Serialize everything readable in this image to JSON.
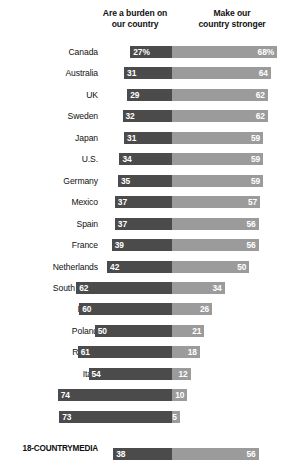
{
  "chart_data": {
    "type": "bar",
    "subtype": "diverging-stacked-bar",
    "title": "",
    "xlabel": "",
    "ylabel": "",
    "grid": false,
    "legend_position": "top",
    "axis_note": "Percent; left segment diverges leftward from a shared center line, right segment extends rightward",
    "series": [
      {
        "name": "Are a burden on our country",
        "color": "#4b4b4b",
        "direction": "left"
      },
      {
        "name": "Make our country stronger",
        "color": "#9b9b9b",
        "direction": "right"
      }
    ],
    "categories": [
      "Canada",
      "Australia",
      "UK",
      "Sweden",
      "Japan",
      "U.S.",
      "Germany",
      "Mexico",
      "Spain",
      "France",
      "Netherlands",
      "South Africa",
      "Israel",
      "Poland",
      "Russia",
      "Italy",
      "Greece",
      "Hungary",
      "18-COUNTRY MEDIA"
    ],
    "rows": [
      {
        "label": "Canada",
        "left": 27,
        "right": 68,
        "left_text": "27%",
        "right_text": "68%",
        "median": false
      },
      {
        "label": "Australia",
        "left": 31,
        "right": 64,
        "left_text": "31",
        "right_text": "64",
        "median": false
      },
      {
        "label": "UK",
        "left": 29,
        "right": 62,
        "left_text": "29",
        "right_text": "62",
        "median": false
      },
      {
        "label": "Sweden",
        "left": 32,
        "right": 62,
        "left_text": "32",
        "right_text": "62",
        "median": false
      },
      {
        "label": "Japan",
        "left": 31,
        "right": 59,
        "left_text": "31",
        "right_text": "59",
        "median": false
      },
      {
        "label": "U.S.",
        "left": 34,
        "right": 59,
        "left_text": "34",
        "right_text": "59",
        "median": false
      },
      {
        "label": "Germany",
        "left": 35,
        "right": 59,
        "left_text": "35",
        "right_text": "59",
        "median": false
      },
      {
        "label": "Mexico",
        "left": 37,
        "right": 57,
        "left_text": "37",
        "right_text": "57",
        "median": false
      },
      {
        "label": "Spain",
        "left": 37,
        "right": 56,
        "left_text": "37",
        "right_text": "56",
        "median": false
      },
      {
        "label": "France",
        "left": 39,
        "right": 56,
        "left_text": "39",
        "right_text": "56",
        "median": false
      },
      {
        "label": "Netherlands",
        "left": 42,
        "right": 50,
        "left_text": "42",
        "right_text": "50",
        "median": false
      },
      {
        "label": "South Africa",
        "left": 62,
        "right": 34,
        "left_text": "62",
        "right_text": "34",
        "median": false
      },
      {
        "label": "Israel",
        "left": 60,
        "right": 26,
        "left_text": "60",
        "right_text": "26",
        "median": false
      },
      {
        "label": "Poland",
        "left": 50,
        "right": 21,
        "left_text": "50",
        "right_text": "21",
        "median": false
      },
      {
        "label": "Russia",
        "left": 61,
        "right": 18,
        "left_text": "61",
        "right_text": "18",
        "median": false
      },
      {
        "label": "Italy",
        "left": 54,
        "right": 12,
        "left_text": "54",
        "right_text": "12",
        "median": false
      },
      {
        "label": "Greece",
        "left": 74,
        "right": 10,
        "left_text": "74",
        "right_text": "10",
        "median": false
      },
      {
        "label": "Hungary",
        "left": 73,
        "right": 5,
        "left_text": "73",
        "right_text": "5",
        "median": false
      },
      {
        "label": "18-COUNTRY MEDIA",
        "label_line1": "18-COUNTRY",
        "label_line2": "MEDIA",
        "left": 38,
        "right": 56,
        "left_text": "38",
        "right_text": "56",
        "median": true
      }
    ]
  },
  "header": {
    "left_line1": "Are a burden on",
    "left_line2": "our country",
    "right_line1": "Make our",
    "right_line2": "country stronger"
  },
  "colors": {
    "burden": "#4b4b4b",
    "stronger": "#9b9b9b",
    "background": "#ffffff",
    "text": "#111111",
    "value_text": "#ffffff"
  }
}
